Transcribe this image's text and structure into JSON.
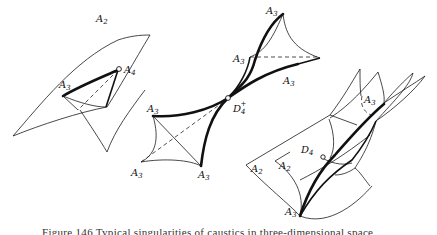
{
  "figure": {
    "caption": "Figure 146  Typical singularities of caustics in three-dimensional space",
    "left_surface": {
      "labels": [
        {
          "id": "A2",
          "text": "A",
          "sub": "2"
        },
        {
          "id": "A3",
          "text": "A",
          "sub": "3"
        },
        {
          "id": "A4",
          "text": "A",
          "sub": "4"
        }
      ]
    },
    "middle_surface": {
      "labels": [
        {
          "id": "A3-top",
          "text": "A",
          "sub": "3"
        },
        {
          "id": "A3-upper-left",
          "text": "A",
          "sub": "3"
        },
        {
          "id": "A3-upper-right",
          "text": "A",
          "sub": "3"
        },
        {
          "id": "A3-lower-left",
          "text": "A",
          "sub": "3"
        },
        {
          "id": "A3-bottom-left",
          "text": "A",
          "sub": "3"
        },
        {
          "id": "A3-bottom-right",
          "text": "A",
          "sub": "3"
        },
        {
          "id": "D4-plus",
          "text": "D",
          "sub": "4",
          "sup": "+"
        }
      ]
    },
    "right_surface": {
      "labels": [
        {
          "id": "A3-top",
          "text": "A",
          "sub": "3"
        },
        {
          "id": "D4-minus",
          "text": "D",
          "sub": "4"
        },
        {
          "id": "A2-left",
          "text": "A",
          "sub": "2"
        },
        {
          "id": "A2-right",
          "text": "A",
          "sub": "2"
        },
        {
          "id": "A3-bottom",
          "text": "A",
          "sub": "3"
        }
      ]
    }
  }
}
